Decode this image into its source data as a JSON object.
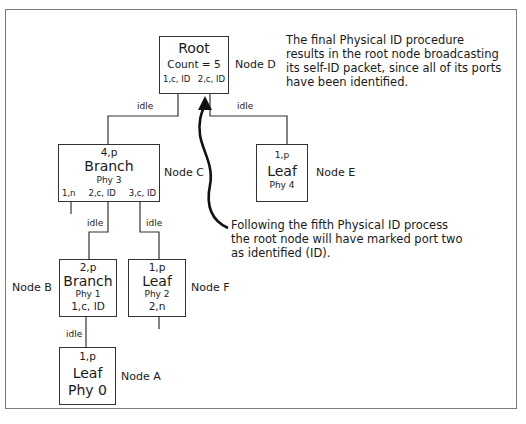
{
  "diagram": {
    "type": "tree"
  },
  "nodes": {
    "root": {
      "title": "Root",
      "count": "Count = 5",
      "port1": "1,c, ID",
      "port2": "2,c, ID",
      "label": "Node D"
    },
    "c": {
      "port_top": "4,p",
      "title": "Branch",
      "phy": "Phy 3",
      "port1": "1,n",
      "port2": "2,c, ID",
      "port3": "3,c, ID",
      "label": "Node C"
    },
    "e": {
      "port_top": "1,p",
      "title": "Leaf",
      "phy": "Phy 4",
      "label": "Node E"
    },
    "b": {
      "port_top": "2,p",
      "title": "Branch",
      "phy": "Phy 1",
      "port_bottom": "1,c, ID",
      "label": "Node B"
    },
    "f": {
      "port_top": "1,p",
      "title": "Leaf",
      "phy": "Phy 2",
      "port_bottom": "2,n",
      "label": "Node F"
    },
    "a": {
      "port_top": "1,p",
      "title": "Leaf",
      "phy": "Phy 0",
      "label": "Node A"
    }
  },
  "links": {
    "root_c": "idle",
    "root_e": "idle",
    "c_b": "idle",
    "c_f": "idle",
    "b_a": "idle"
  },
  "notes": {
    "top": [
      "The final Physical ID procedure",
      "results in the root node broadcasting",
      "its self-ID packet, since all of its ports",
      "have been identified."
    ],
    "bottom": [
      "Following the fifth Physical ID process",
      "the root node will have marked port two",
      "as identified (ID)."
    ]
  },
  "colors": {
    "line": "#333333",
    "frame": "#7a7a7a",
    "arrow": "#111111"
  }
}
